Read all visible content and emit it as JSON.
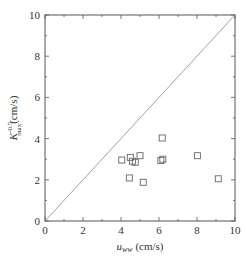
{
  "chart_data": {
    "type": "scatter",
    "title": "",
    "xlabel": "u_ww (cm/s)",
    "xlabel_main": "u",
    "xlabel_sub": "ww",
    "xlabel_unit": " (cm/s)",
    "ylabel": "K_max^-0.5 (cm/s)",
    "ylabel_main": "K",
    "ylabel_sup": "-0.5",
    "ylabel_sub": "max",
    "ylabel_unit": "(cm/s)",
    "xlim": [
      0,
      10
    ],
    "ylim": [
      0,
      10
    ],
    "xticks": [
      0,
      2,
      4,
      6,
      8,
      10
    ],
    "yticks": [
      0,
      2,
      4,
      6,
      8,
      10
    ],
    "grid": false,
    "legend": null,
    "reference_line": {
      "label": "1:1 line",
      "from": [
        0,
        0
      ],
      "to": [
        10,
        10
      ]
    },
    "series": [
      {
        "name": "data",
        "marker": "open-square",
        "points": [
          {
            "x": 4.04,
            "y": 2.96
          },
          {
            "x": 4.49,
            "y": 3.09
          },
          {
            "x": 4.6,
            "y": 2.9
          },
          {
            "x": 4.75,
            "y": 2.85
          },
          {
            "x": 5.0,
            "y": 3.17
          },
          {
            "x": 4.44,
            "y": 2.09
          },
          {
            "x": 5.17,
            "y": 1.88
          },
          {
            "x": 6.17,
            "y": 4.03
          },
          {
            "x": 6.1,
            "y": 2.94
          },
          {
            "x": 6.2,
            "y": 3.0
          },
          {
            "x": 8.02,
            "y": 3.17
          },
          {
            "x": 9.12,
            "y": 2.05
          }
        ]
      }
    ]
  },
  "style": {
    "axis_color": "#555555",
    "marker_color": "#666666",
    "line_color": "#888888"
  }
}
